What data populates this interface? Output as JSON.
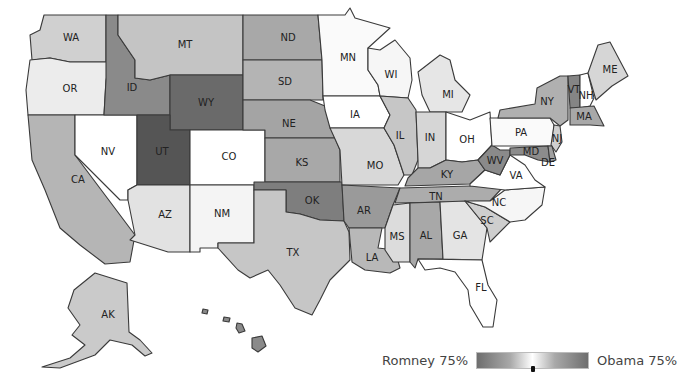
{
  "map": {
    "title": "2012 Presidential Election Results by State",
    "states": [
      {
        "id": "WA",
        "label": "WA",
        "fill": "#d0d0d0"
      },
      {
        "id": "OR",
        "label": "OR",
        "fill": "#ececec"
      },
      {
        "id": "CA",
        "label": "CA",
        "fill": "#b5b5b5"
      },
      {
        "id": "NV",
        "label": "NV",
        "fill": "#ffffff"
      },
      {
        "id": "ID",
        "label": "ID",
        "fill": "#8a8a8a"
      },
      {
        "id": "MT",
        "label": "MT",
        "fill": "#c4c4c4"
      },
      {
        "id": "WY",
        "label": "WY",
        "fill": "#6a6a6a"
      },
      {
        "id": "UT",
        "label": "UT",
        "fill": "#555555"
      },
      {
        "id": "AZ",
        "label": "AZ",
        "fill": "#e2e2e2"
      },
      {
        "id": "CO",
        "label": "CO",
        "fill": "#ffffff"
      },
      {
        "id": "NM",
        "label": "NM",
        "fill": "#f4f4f4"
      },
      {
        "id": "ND",
        "label": "ND",
        "fill": "#a8a8a8"
      },
      {
        "id": "SD",
        "label": "SD",
        "fill": "#b4b4b4"
      },
      {
        "id": "NE",
        "label": "NE",
        "fill": "#a4a4a4"
      },
      {
        "id": "KS",
        "label": "KS",
        "fill": "#a8a8a8"
      },
      {
        "id": "OK",
        "label": "OK",
        "fill": "#7e7e7e"
      },
      {
        "id": "TX",
        "label": "TX",
        "fill": "#c6c6c6"
      },
      {
        "id": "MN",
        "label": "MN",
        "fill": "#fafafa"
      },
      {
        "id": "IA",
        "label": "IA",
        "fill": "#ffffff"
      },
      {
        "id": "MO",
        "label": "MO",
        "fill": "#d8d8d8"
      },
      {
        "id": "AR",
        "label": "AR",
        "fill": "#9a9a9a"
      },
      {
        "id": "LA",
        "label": "LA",
        "fill": "#b8b8b8"
      },
      {
        "id": "WI",
        "label": "WI",
        "fill": "#f6f6f6"
      },
      {
        "id": "IL",
        "label": "IL",
        "fill": "#c6c6c6"
      },
      {
        "id": "MI",
        "label": "MI",
        "fill": "#e6e6e6"
      },
      {
        "id": "IN",
        "label": "IN",
        "fill": "#d6d6d6"
      },
      {
        "id": "OH",
        "label": "OH",
        "fill": "#ffffff"
      },
      {
        "id": "KY",
        "label": "KY",
        "fill": "#a6a6a6"
      },
      {
        "id": "TN",
        "label": "TN",
        "fill": "#acacac"
      },
      {
        "id": "MS",
        "label": "MS",
        "fill": "#dcdcdc"
      },
      {
        "id": "AL",
        "label": "AL",
        "fill": "#a8a8a8"
      },
      {
        "id": "GA",
        "label": "GA",
        "fill": "#e4e4e4"
      },
      {
        "id": "FL",
        "label": "FL",
        "fill": "#ffffff"
      },
      {
        "id": "SC",
        "label": "SC",
        "fill": "#cecece"
      },
      {
        "id": "NC",
        "label": "NC",
        "fill": "#f6f6f6"
      },
      {
        "id": "VA",
        "label": "VA",
        "fill": "#ffffff"
      },
      {
        "id": "WV",
        "label": "WV",
        "fill": "#8a8a8a"
      },
      {
        "id": "PA",
        "label": "PA",
        "fill": "#fafafa"
      },
      {
        "id": "NY",
        "label": "NY",
        "fill": "#b0b0b0"
      },
      {
        "id": "VT",
        "label": "VT",
        "fill": "#858585"
      },
      {
        "id": "NH",
        "label": "NH",
        "fill": "#ffffff"
      },
      {
        "id": "ME",
        "label": "ME",
        "fill": "#d6d6d6"
      },
      {
        "id": "MA",
        "label": "MA",
        "fill": "#a8a8a8"
      },
      {
        "id": "NJ",
        "label": "NJ",
        "fill": "#cfcfcf"
      },
      {
        "id": "MD",
        "label": "MD",
        "fill": "#8c8c8c"
      },
      {
        "id": "DE",
        "label": "DE",
        "fill": "#a0a0a0"
      },
      {
        "id": "AK",
        "label": "AK",
        "fill": "#cacaca"
      },
      {
        "id": "HI",
        "label": "",
        "fill": "#8a8a8a"
      }
    ]
  },
  "legend": {
    "left_label": "Romney 75%",
    "right_label": "Obama 75%",
    "colors": {
      "extreme": "#6e6e6e",
      "mid": "#a9a9a9",
      "center": "#ffffff"
    }
  }
}
